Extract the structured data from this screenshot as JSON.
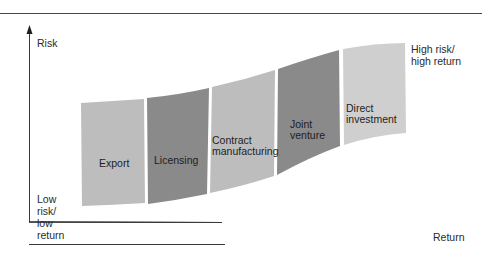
{
  "diagram": {
    "type": "risk-return staircase",
    "axes": {
      "y_label": "Risk",
      "x_label": "Return"
    },
    "corner_labels": {
      "low": [
        "Low",
        "risk/",
        "low",
        "return"
      ],
      "high": [
        "High risk/",
        "high return"
      ]
    },
    "bands": [
      {
        "name": "export",
        "lines": [
          "Export"
        ],
        "color": "#bdbdbd"
      },
      {
        "name": "licensing",
        "lines": [
          "Licensing"
        ],
        "color": "#8a8a8a"
      },
      {
        "name": "contract-manufacturing",
        "lines": [
          "Contract",
          "manufacturing"
        ],
        "color": "#bdbdbd"
      },
      {
        "name": "joint-venture",
        "lines": [
          "Joint",
          "venture"
        ],
        "color": "#8a8a8a"
      },
      {
        "name": "direct-investment",
        "lines": [
          "Direct",
          "investment"
        ],
        "color": "#cfcfcf"
      }
    ],
    "colors": {
      "axis": "#3a3a3a",
      "light_band": "#bdbdbd",
      "dark_band": "#8a8a8a",
      "lightest_band": "#cfcfcf"
    }
  }
}
